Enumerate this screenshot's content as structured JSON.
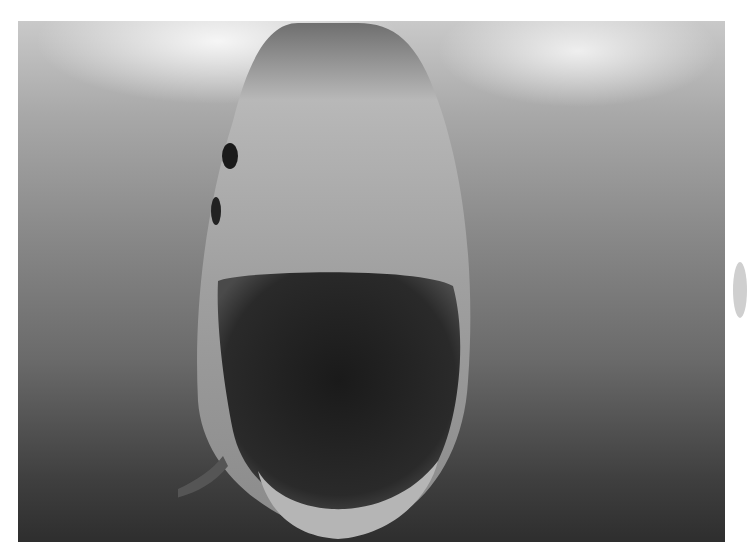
{
  "image": {
    "subject": "Great white shark facing camera underwater with open mouth",
    "style": "black-and-white photograph",
    "colors": {
      "background": "#ffffff",
      "water_light": "#c9c9c9",
      "water_dark": "#2e2e2e"
    }
  }
}
